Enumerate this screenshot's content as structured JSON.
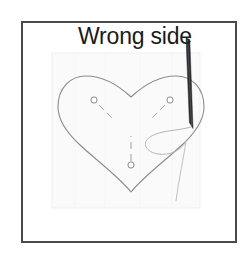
{
  "figure": {
    "title": "Wrong side",
    "kind": "sewing-illustration",
    "frame": {
      "border_color": "#4a4a4a",
      "border_width_px": 2,
      "background": "#ffffff",
      "x": 21,
      "y": 21,
      "width": 216,
      "height": 222
    },
    "fabric": {
      "name": "fabric-square",
      "fill": "#fafafa",
      "stroke": "#f0f0f0",
      "x": 52,
      "y": 53,
      "width": 148,
      "height": 155
    },
    "heart": {
      "name": "heart-outline",
      "stroke": "#8c8c90",
      "stroke_width": 1,
      "fill": "none",
      "apex_x": 131,
      "apex_y": 192,
      "notch_y": 89,
      "lobe_top_y": 76
    },
    "pins": [
      {
        "name": "pin-left",
        "head_x": 94,
        "head_y": 100,
        "tip_x": 113,
        "tip_y": 119,
        "color": "#9a9a9e"
      },
      {
        "name": "pin-right",
        "head_x": 170,
        "head_y": 100,
        "tip_x": 151,
        "tip_y": 119,
        "color": "#9a9a9e"
      },
      {
        "name": "pin-center",
        "head_x": 131,
        "head_y": 165,
        "tip_x": 131,
        "tip_y": 136,
        "color": "#9a9a9e"
      }
    ],
    "needle": {
      "name": "needle",
      "color": "#2a2a2e",
      "start_x": 188,
      "start_y": 41,
      "tip_x": 192,
      "tip_y": 129
    },
    "thread": {
      "name": "thread",
      "color": "#b4b4b8",
      "stroke_width": 1,
      "tail_end_x": 177,
      "tail_end_y": 201
    },
    "label": {
      "name": "wrong-side-label",
      "text": "Wrong side",
      "x": 78,
      "y": 44,
      "font_size": 23,
      "color": "#1a1a1a"
    },
    "leader_line": {
      "name": "leader-line",
      "color": "#3a3a3e",
      "from_x": 186,
      "from_y": 38,
      "to_x": 192,
      "to_y": 60
    }
  }
}
